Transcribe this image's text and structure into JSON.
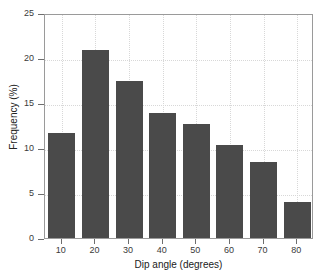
{
  "chart_data": {
    "type": "bar",
    "title": "",
    "xlabel": "Dip angle (degrees)",
    "ylabel": "Frequency (%)",
    "categories": [
      "10",
      "20",
      "30",
      "40",
      "50",
      "60",
      "70",
      "80"
    ],
    "values": [
      11.7,
      20.9,
      17.4,
      13.9,
      12.7,
      10.3,
      8.5,
      4.0
    ],
    "xlim": [
      5,
      85
    ],
    "ylim": [
      0,
      25
    ],
    "yticks": [
      "0",
      "5",
      "10",
      "15",
      "20",
      "25"
    ],
    "ytick_values": [
      0,
      5,
      10,
      15,
      20,
      25
    ],
    "xticks": [
      "10",
      "20",
      "30",
      "40",
      "50",
      "60",
      "70",
      "80"
    ],
    "xtick_values": [
      10,
      20,
      30,
      40,
      50,
      60,
      70,
      80
    ],
    "grid": true,
    "legend": null,
    "bar_color": "#4a4a4a",
    "grid_color": "#d8d8d8",
    "axis_color": "#9a9a9a",
    "background_color": "#ffffff"
  }
}
